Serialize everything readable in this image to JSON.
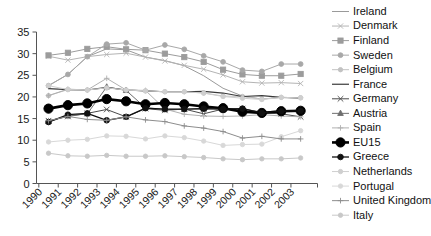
{
  "chart_data": {
    "type": "line",
    "title": "",
    "xlabel": "",
    "ylabel": "",
    "grid": false,
    "legend_position": "right",
    "x": [
      1990,
      1991,
      1992,
      1993,
      1994,
      1995,
      1996,
      1997,
      1998,
      1999,
      2000,
      2001,
      2002,
      2003
    ],
    "xticklabels": [
      "1990",
      "1991",
      "1992",
      "1993",
      "1994",
      "1995",
      "1996",
      "1997",
      "1998",
      "1999",
      "2000",
      "2001",
      "2002",
      "2003"
    ],
    "ylim": [
      0,
      35
    ],
    "yticks": [
      0,
      5,
      10,
      15,
      20,
      25,
      30,
      35
    ],
    "yticklabels": [
      "0",
      "5",
      "10",
      "15",
      "20",
      "25",
      "30",
      "35"
    ],
    "series": [
      {
        "name": "Ireland",
        "color": "#9a9a9a",
        "width": 1,
        "marker": "none",
        "msize": 0,
        "values": [
          22.6,
          25.2,
          29.3,
          31.1,
          30.9,
          29.2,
          28.4,
          27.2,
          24.9,
          22.0,
          20.2,
          19.5,
          19.9,
          19.8
        ]
      },
      {
        "name": "Denmark",
        "color": "#b4b4b4",
        "width": 1,
        "marker": "x",
        "msize": 2.6,
        "values": [
          29.4,
          28.5,
          29.3,
          29.8,
          30.1,
          29.2,
          28.3,
          27.3,
          26.4,
          25.1,
          23.5,
          23.2,
          23.3,
          23.1
        ]
      },
      {
        "name": "Finland",
        "color": "#9c9c9c",
        "width": 1,
        "marker": "square",
        "msize": 2.6,
        "values": [
          29.6,
          30.2,
          31.1,
          31.6,
          31.0,
          30.8,
          30.0,
          29.2,
          28.1,
          26.3,
          25.2,
          24.9,
          24.9,
          25.3
        ]
      },
      {
        "name": "Sweden",
        "color": "#a8a8a8",
        "width": 1,
        "marker": "circle",
        "msize": 2.4,
        "values": [
          22.6,
          25.2,
          29.3,
          32.2,
          32.5,
          30.8,
          32.0,
          31.0,
          29.5,
          28.1,
          26.2,
          25.9,
          27.6,
          27.6
        ]
      },
      {
        "name": "Belgium",
        "color": "#c2c2c2",
        "width": 1,
        "marker": "circle",
        "msize": 2.2,
        "values": [
          20.3,
          21.7,
          21.6,
          22.1,
          21.6,
          21.4,
          21.2,
          21.2,
          20.9,
          20.2,
          20.1,
          19.5,
          19.9,
          19.8
        ]
      },
      {
        "name": "France",
        "color": "#3a3a3a",
        "width": 1.2,
        "marker": "none",
        "msize": 0,
        "values": [
          21.9,
          21.7,
          21.6,
          22.2,
          21.6,
          21.4,
          21.2,
          21.2,
          21.3,
          20.9,
          20.1,
          20.3,
          19.9,
          19.8
        ]
      },
      {
        "name": "Germany",
        "color": "#4a4a4a",
        "width": 1,
        "marker": "x",
        "msize": 2.8,
        "values": [
          14.5,
          15.5,
          16.2,
          17.1,
          15.4,
          17.3,
          16.9,
          17.2,
          16.1,
          17.2,
          17.3,
          16.3,
          16.1,
          15.4
        ]
      },
      {
        "name": "Austria",
        "color": "#6e6e6e",
        "width": 1,
        "marker": "triangle",
        "msize": 2.8,
        "values": [
          14.3,
          15.6,
          16.1,
          22.3,
          21.5,
          17.5,
          17.1,
          17.1,
          17.3,
          17.2,
          17.2,
          16.5,
          16.8,
          16.8
        ]
      },
      {
        "name": "Spain",
        "color": "#b0b0b0",
        "width": 1,
        "marker": "plus",
        "msize": 2.8,
        "values": [
          20.3,
          21.8,
          21.6,
          24.3,
          21.6,
          21.5,
          17.2,
          16.0,
          15.6,
          15.5,
          15.6,
          15.9,
          15.6,
          15.4
        ]
      },
      {
        "name": "EU15",
        "color": "#000000",
        "width": 2.6,
        "marker": "circle",
        "msize": 4.6,
        "values": [
          17.3,
          18.1,
          18.5,
          19.5,
          19.0,
          18.3,
          18.6,
          18.3,
          17.8,
          17.4,
          16.6,
          16.3,
          16.7,
          16.8
        ]
      },
      {
        "name": "Greece",
        "color": "#111111",
        "width": 1.3,
        "marker": "circle",
        "msize": 2.8,
        "values": [
          14.2,
          15.9,
          16.2,
          14.6,
          15.4,
          17.4,
          17.2,
          17.2,
          17.3,
          17.2,
          17.3,
          16.3,
          16.7,
          16.8
        ]
      },
      {
        "name": "Netherlands",
        "color": "#cfcfcf",
        "width": 1,
        "marker": "circle",
        "msize": 2.2,
        "values": [
          22.6,
          21.7,
          21.6,
          22.1,
          21.6,
          21.4,
          21.2,
          21.2,
          20.9,
          20.1,
          19.7,
          19.4,
          19.9,
          19.8
        ]
      },
      {
        "name": "Portugal",
        "color": "#d8d8d8",
        "width": 1,
        "marker": "circle",
        "msize": 2.2,
        "values": [
          9.6,
          10.0,
          10.2,
          11.0,
          10.9,
          10.3,
          11.0,
          10.6,
          9.8,
          8.8,
          9.0,
          9.1,
          10.8,
          12.2
        ]
      },
      {
        "name": "United Kingdom",
        "color": "#8d8d8d",
        "width": 1,
        "marker": "plus",
        "msize": 2.8,
        "values": [
          14.5,
          15.5,
          14.8,
          14.6,
          15.4,
          14.7,
          14.3,
          13.3,
          12.8,
          12.0,
          10.5,
          10.9,
          10.3,
          10.3
        ]
      },
      {
        "name": "Italy",
        "color": "#c8c8c8",
        "width": 1,
        "marker": "circle",
        "msize": 2.2,
        "values": [
          7.0,
          6.4,
          6.3,
          6.5,
          6.3,
          6.3,
          6.4,
          6.2,
          6.0,
          5.7,
          5.5,
          5.7,
          5.7,
          5.9
        ]
      }
    ]
  },
  "legend": {
    "items": [
      {
        "label": "Ireland"
      },
      {
        "label": "Denmark"
      },
      {
        "label": "Finland"
      },
      {
        "label": "Sweden"
      },
      {
        "label": "Belgium"
      },
      {
        "label": "France"
      },
      {
        "label": "Germany"
      },
      {
        "label": "Austria"
      },
      {
        "label": "Spain"
      },
      {
        "label": "EU15"
      },
      {
        "label": "Greece"
      },
      {
        "label": "Netherlands"
      },
      {
        "label": "Portugal"
      },
      {
        "label": "United Kingdom"
      },
      {
        "label": "Italy"
      }
    ]
  }
}
